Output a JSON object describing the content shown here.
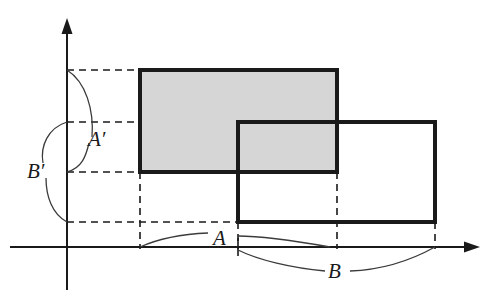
{
  "figure": {
    "background_color": "#ffffff",
    "ink_color": "#1a1a1a",
    "shaded_fill_color": "#d6d6d6"
  },
  "axes": {
    "origin": {
      "x": 67,
      "y": 247
    },
    "x_axis": {
      "from_x": 10,
      "to_x": 480,
      "y": 247,
      "arrow": "right"
    },
    "y_axis": {
      "x": 67,
      "from_y": 247,
      "to_y": 18,
      "arrow": "up"
    },
    "stroke_width": 2
  },
  "rectangles": [
    {
      "name": "shaded-rectangle",
      "label": "A × A′",
      "shaded": true,
      "fill": "#d6d6d6",
      "x0": 140,
      "y0": 70,
      "x1": 337,
      "y1": 172,
      "stroke_width": 4
    },
    {
      "name": "open-rectangle",
      "label": "B × B′",
      "shaded": false,
      "fill": "none",
      "x0": 238,
      "y0": 122,
      "x1": 435,
      "y1": 222,
      "stroke_width": 4
    }
  ],
  "guide_lines": {
    "dash_pattern": "7,5",
    "stroke_width": 1.6,
    "horizontal": [
      {
        "name": "guide-y-top",
        "y": 70,
        "from_x": 67,
        "to_x": 140
      },
      {
        "name": "guide-y-mid",
        "y": 172,
        "from_x": 67,
        "to_x": 238
      },
      {
        "name": "guide-y-lower",
        "y": 122,
        "from_x": 67,
        "to_x": 238
      },
      {
        "name": "guide-y-bottom",
        "y": 222,
        "from_x": 67,
        "to_x": 238
      }
    ],
    "vertical": [
      {
        "name": "guide-x-a-left",
        "x": 140,
        "from_y": 172,
        "to_y": 247
      },
      {
        "name": "guide-x-a-right",
        "x": 337,
        "from_y": 172,
        "to_y": 247
      },
      {
        "name": "guide-x-b-left",
        "x": 238,
        "from_y": 222,
        "to_y": 247
      },
      {
        "name": "guide-x-b-right",
        "x": 435,
        "from_y": 222,
        "to_y": 247
      }
    ]
  },
  "braces": [
    {
      "name": "brace-a-prime",
      "label": "A′",
      "orientation": "vertical",
      "from": {
        "x": 67,
        "y": 70
      },
      "to": {
        "x": 67,
        "y": 172
      },
      "label_x": 88,
      "label_y": 146,
      "font_size": 21
    },
    {
      "name": "brace-b-prime",
      "label": "B′",
      "orientation": "vertical",
      "from": {
        "x": 67,
        "y": 122
      },
      "to": {
        "x": 67,
        "y": 222
      },
      "label_x": 40,
      "label_y": 178,
      "font_size": 21
    },
    {
      "name": "brace-a",
      "label": "A",
      "orientation": "horizontal",
      "from": {
        "x": 140,
        "y": 247
      },
      "to": {
        "x": 238,
        "y": 247
      },
      "label_x": 213,
      "label_y": 245,
      "font_size": 21
    },
    {
      "name": "brace-b",
      "label": "B",
      "orientation": "horizontal",
      "from": {
        "x": 238,
        "y": 247
      },
      "to": {
        "x": 435,
        "y": 247
      },
      "label_x": 331,
      "label_y": 275,
      "font_size": 21
    }
  ],
  "tick_marks": [
    {
      "name": "tick-a-endpoint",
      "x": 238,
      "y": 247,
      "half_height": 9
    }
  ],
  "labels": {
    "a_prime": "A′",
    "b_prime": "B′",
    "a": "A",
    "b": "B"
  }
}
